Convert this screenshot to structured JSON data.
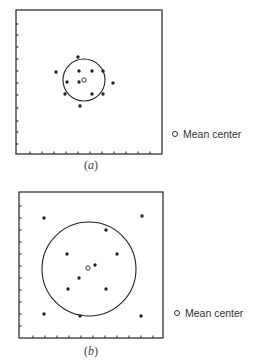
{
  "panels": [
    {
      "id": "a",
      "caption": "(a)",
      "caption_letter": "a",
      "box": {
        "x": 16,
        "y": 10,
        "w": 146,
        "h": 144
      },
      "left_ticks_y": [
        24,
        35,
        47,
        59,
        71,
        83,
        95,
        108,
        121,
        132,
        144
      ],
      "bottom_ticks_x": [
        30,
        42,
        54,
        66,
        78,
        90,
        102,
        114,
        126,
        138,
        150
      ],
      "points": [
        [
          78,
          57
        ],
        [
          56,
          72
        ],
        [
          79,
          71
        ],
        [
          92,
          71
        ],
        [
          103,
          71
        ],
        [
          67,
          82
        ],
        [
          79,
          82
        ],
        [
          113,
          83
        ],
        [
          65,
          94
        ],
        [
          92,
          94
        ],
        [
          103,
          94
        ],
        [
          80,
          106
        ]
      ],
      "mean_center": [
        84,
        80
      ],
      "circle": {
        "cx": 84,
        "cy": 80,
        "r": 21
      },
      "legend": {
        "label": "Mean center",
        "x": 172,
        "y": 128
      }
    },
    {
      "id": "b",
      "caption": "(b)",
      "caption_letter": "b",
      "box": {
        "x": 19,
        "y": 192,
        "w": 144,
        "h": 146
      },
      "left_ticks_y": [
        206,
        218,
        230,
        242,
        254,
        266,
        278,
        290,
        302,
        314,
        326
      ],
      "bottom_ticks_x": [
        33,
        45,
        57,
        69,
        81,
        93,
        105,
        117,
        129,
        141,
        153
      ],
      "points": [
        [
          44,
          218
        ],
        [
          142,
          216
        ],
        [
          106,
          230
        ],
        [
          67,
          254
        ],
        [
          117,
          254
        ],
        [
          95,
          265
        ],
        [
          79,
          278
        ],
        [
          68,
          289
        ],
        [
          106,
          289
        ],
        [
          44,
          314
        ],
        [
          80,
          316
        ],
        [
          141,
          316
        ]
      ],
      "mean_center": [
        88,
        268
      ],
      "circle": {
        "cx": 89,
        "cy": 269,
        "r": 47
      },
      "legend": {
        "label": "Mean center",
        "x": 174,
        "y": 307
      }
    }
  ],
  "legend_label": "Mean center",
  "colors": {
    "ink": "#222222",
    "background": "#ffffff"
  }
}
